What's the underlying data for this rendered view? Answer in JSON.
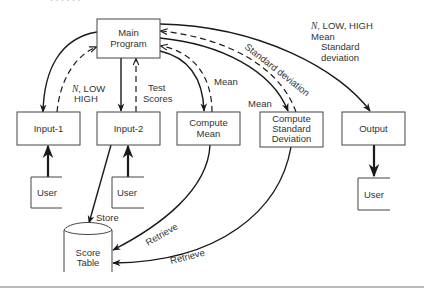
{
  "diagram": {
    "nodes": {
      "main_program": {
        "line1": "Main",
        "line2": "Program"
      },
      "input1": {
        "label": "Input-1"
      },
      "input2": {
        "label": "Input-2"
      },
      "compute_mean": {
        "line1": "Compute",
        "line2": "Mean"
      },
      "compute_sd": {
        "line1": "Compute",
        "line2": "Standard",
        "line3": "Deviation"
      },
      "output": {
        "label": "Output"
      },
      "user1": {
        "label": "User"
      },
      "user2": {
        "label": "User"
      },
      "user3": {
        "label": "User"
      },
      "score_table": {
        "line1": "Score",
        "line2": "Table"
      }
    },
    "edge_labels": {
      "input1_return_n": "N",
      "input1_return_rest": ", LOW",
      "input1_return_line2": "HIGH",
      "input2_return_line1": "Test",
      "input2_return_line2": "Scores",
      "mean_return": "Mean",
      "sd_input_mean": "Mean",
      "sd_return": "Standard deviation",
      "output_n": "N",
      "output_line1_rest": ", LOW, HIGH",
      "output_line2": "Mean",
      "output_line3": "Standard",
      "output_line4": "deviation",
      "store": "Store",
      "retrieve_mean": "Retrieve",
      "retrieve_sd": "Retrieve"
    },
    "colors": {
      "line": "#1a1a1a",
      "box_border": "#444444",
      "text": "#333333",
      "rule": "#777777"
    }
  }
}
